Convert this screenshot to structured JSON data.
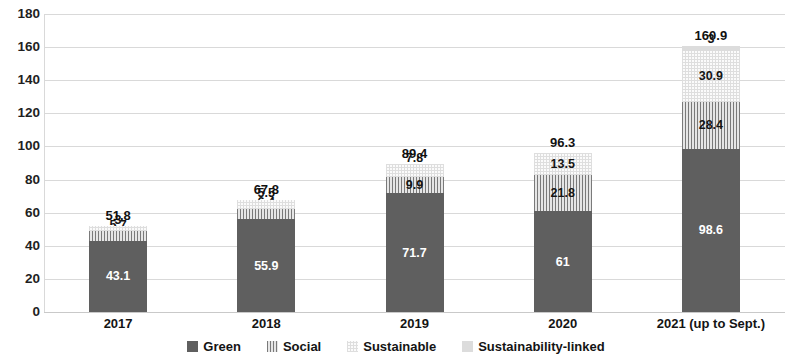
{
  "chart_data": {
    "type": "bar",
    "stacked": true,
    "title": "",
    "subtitle": "",
    "xlabel": "",
    "ylabel": "",
    "categories": [
      "2017",
      "2018",
      "2019",
      "2020",
      "2021 (up to Sept.)"
    ],
    "series": [
      {
        "name": "Green",
        "values": [
          43.1,
          55.9,
          71.7,
          61,
          98.6
        ]
      },
      {
        "name": "Social",
        "values": [
          5.7,
          6.4,
          9.9,
          21.8,
          28.4
        ]
      },
      {
        "name": "Sustainable",
        "values": [
          3,
          5.5,
          7.8,
          13.5,
          30.9
        ]
      },
      {
        "name": "Sustainability-linked",
        "values": [
          null,
          null,
          null,
          null,
          3
        ]
      }
    ],
    "value_labels": {
      "Green": [
        "43.1",
        "55.9",
        "71.7",
        "61",
        "98.6"
      ],
      "Social": [
        "5.7",
        "6.4",
        "9.9",
        "21.8",
        "28.4"
      ],
      "Sustainable": [
        "3",
        "5.5",
        "7.8",
        "13.5",
        "30.9"
      ],
      "Sustainability-linked": [
        "",
        "",
        "",
        "",
        "3"
      ]
    },
    "totals": [
      "51.8",
      "67.8",
      "89.4",
      "96.3",
      "160.9"
    ],
    "ylim": [
      0,
      180
    ],
    "yticks": [
      0,
      20,
      40,
      60,
      80,
      100,
      120,
      140,
      160,
      180
    ],
    "ytick_labels": [
      "0",
      "20",
      "40",
      "60",
      "80",
      "100",
      "120",
      "140",
      "160",
      "180"
    ],
    "grid": true,
    "legend_position": "bottom",
    "colors": {
      "Green": "#5f5f5f",
      "Social": "#d0d0d0",
      "Sustainable": "#fbfbfb",
      "Sustainability-linked": "#dcdcdc",
      "gridline": "#d9d9d9",
      "background": "#ffffff",
      "text": "#141414"
    }
  },
  "legend": {
    "items": [
      {
        "label": "Green",
        "swatch": "green-swatch"
      },
      {
        "label": "Social",
        "swatch": "social-swatch"
      },
      {
        "label": "Sustainable",
        "swatch": "sustainable-swatch"
      },
      {
        "label": "Sustainability-linked",
        "swatch": "sustainability-linked-swatch"
      }
    ]
  }
}
